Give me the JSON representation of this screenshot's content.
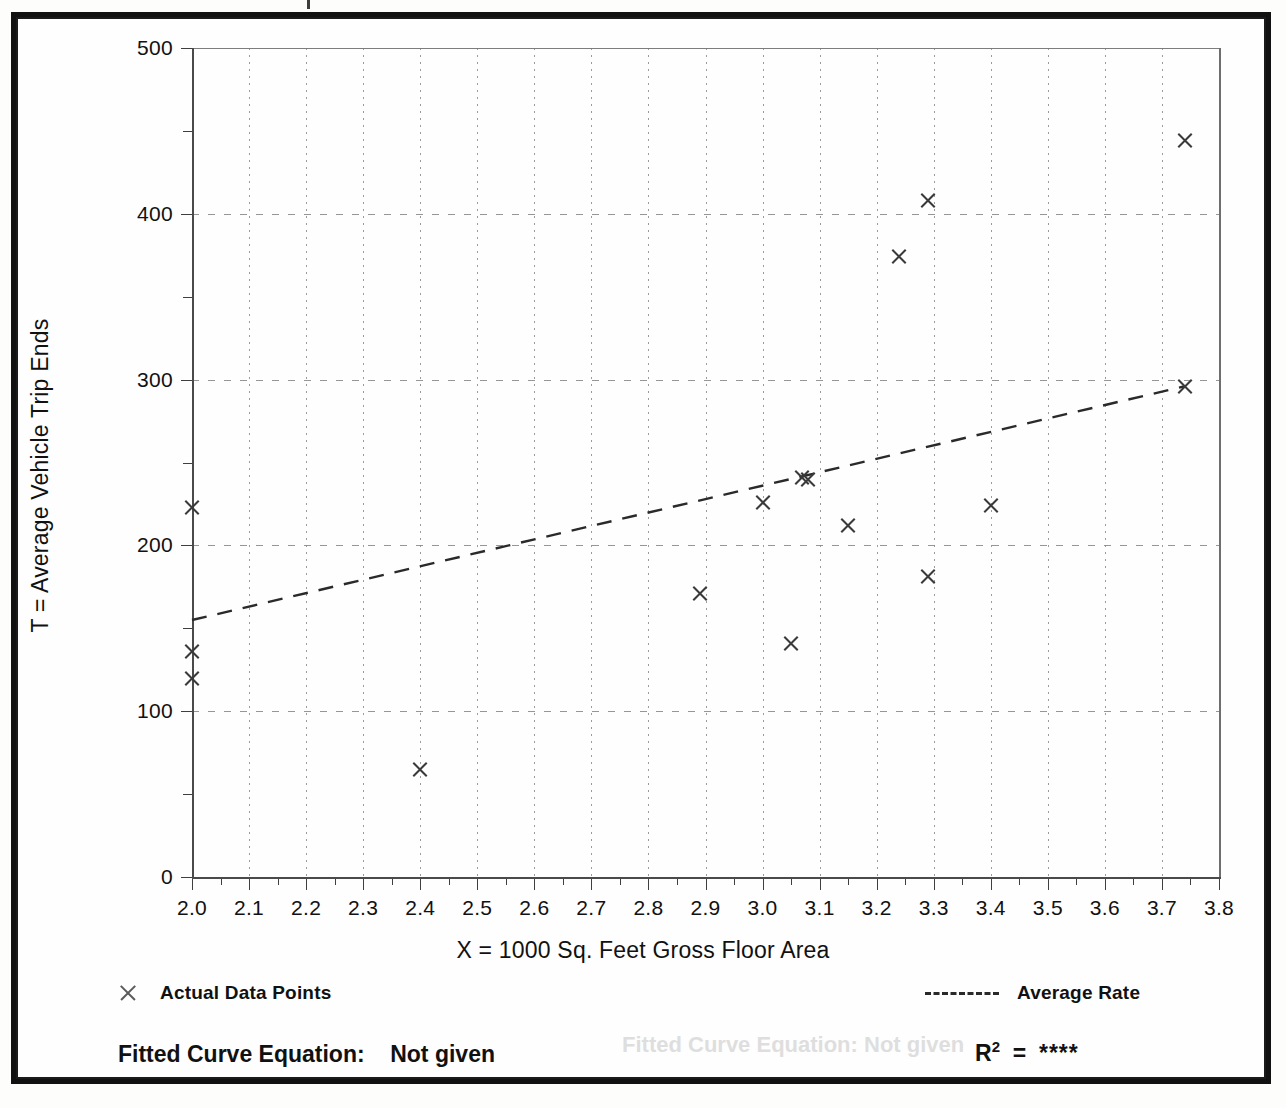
{
  "chart_data": {
    "type": "scatter",
    "title": "",
    "xlabel": "X = 1000 Sq. Feet Gross Floor Area",
    "ylabel": "T = Average Vehicle Trip Ends",
    "xlim": [
      2.0,
      3.8
    ],
    "ylim": [
      0,
      500
    ],
    "x_tick_step": 0.1,
    "y_tick_step": 100,
    "y_minor_step": 50,
    "grid": "dotted-both-axes",
    "legend_position": "below-plot",
    "x_ticks": [
      "2.0",
      "2.1",
      "2.2",
      "2.3",
      "2.4",
      "2.5",
      "2.6",
      "2.7",
      "2.8",
      "2.9",
      "3.0",
      "3.1",
      "3.2",
      "3.3",
      "3.4",
      "3.5",
      "3.6",
      "3.7",
      "3.8"
    ],
    "y_ticks": [
      "0",
      "100",
      "200",
      "300",
      "400",
      "500"
    ],
    "series": [
      {
        "name": "Actual Data Points",
        "marker": "x",
        "color": "#3a3a3a",
        "points": [
          {
            "x": 2.0,
            "y": 223
          },
          {
            "x": 2.0,
            "y": 136
          },
          {
            "x": 2.0,
            "y": 120
          },
          {
            "x": 2.4,
            "y": 65
          },
          {
            "x": 2.89,
            "y": 171
          },
          {
            "x": 3.0,
            "y": 226
          },
          {
            "x": 3.05,
            "y": 141
          },
          {
            "x": 3.07,
            "y": 241
          },
          {
            "x": 3.08,
            "y": 240
          },
          {
            "x": 3.15,
            "y": 212
          },
          {
            "x": 3.24,
            "y": 374
          },
          {
            "x": 3.29,
            "y": 408
          },
          {
            "x": 3.29,
            "y": 181
          },
          {
            "x": 3.4,
            "y": 224
          },
          {
            "x": 3.74,
            "y": 444
          },
          {
            "x": 3.74,
            "y": 296
          }
        ]
      },
      {
        "name": "Average Rate",
        "type": "line",
        "style": "dashed",
        "color": "#2a2a2a",
        "endpoints": [
          {
            "x": 2.0,
            "y": 155
          },
          {
            "x": 3.74,
            "y": 296
          }
        ]
      }
    ]
  },
  "axes": {
    "x_title": "X = 1000 Sq. Feet Gross Floor Area",
    "y_title": "T = Average Vehicle Trip Ends"
  },
  "legend": {
    "data_points_label": "Actual Data Points",
    "average_rate_label": "Average Rate"
  },
  "notes": {
    "fitted_curve_label": "Fitted Curve Equation:",
    "fitted_curve_value": "Not given",
    "r_squared_label": "R",
    "r_squared_exponent": "2",
    "r_squared_equals": "=",
    "r_squared_value": "****"
  },
  "ghost_text": {
    "fitted_bleed": "Fitted Curve Equation:  Not given"
  }
}
